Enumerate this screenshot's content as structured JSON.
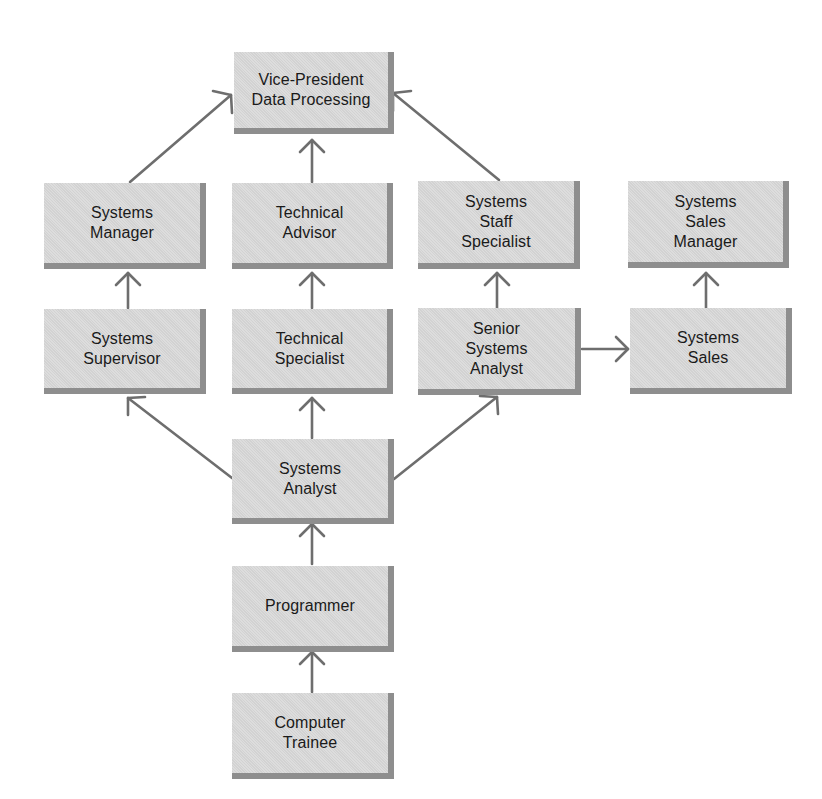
{
  "diagram": {
    "type": "career-path-flowchart",
    "colors": {
      "box_fill": "#d9d9d9",
      "box_shadow": "#8e8e8e",
      "arrow": "#6e6e6e",
      "text": "#1a1a1a",
      "background": "#ffffff"
    },
    "nodes": {
      "vp": {
        "label": "Vice-President\nData Processing"
      },
      "systems_manager": {
        "label": "Systems\nManager"
      },
      "technical_advisor": {
        "label": "Technical\nAdvisor"
      },
      "systems_staff_specialist": {
        "label": "Systems\nStaff\nSpecialist"
      },
      "systems_sales_manager": {
        "label": "Systems\nSales\nManager"
      },
      "systems_supervisor": {
        "label": "Systems\nSupervisor"
      },
      "technical_specialist": {
        "label": "Technical\nSpecialist"
      },
      "senior_systems_analyst": {
        "label": "Senior\nSystems\nAnalyst"
      },
      "systems_sales": {
        "label": "Systems\nSales"
      },
      "systems_analyst": {
        "label": "Systems\nAnalyst"
      },
      "programmer": {
        "label": "Programmer"
      },
      "computer_trainee": {
        "label": "Computer\nTrainee"
      }
    },
    "edges": [
      {
        "from": "computer_trainee",
        "to": "programmer"
      },
      {
        "from": "programmer",
        "to": "systems_analyst"
      },
      {
        "from": "systems_analyst",
        "to": "systems_supervisor"
      },
      {
        "from": "systems_analyst",
        "to": "technical_specialist"
      },
      {
        "from": "systems_analyst",
        "to": "senior_systems_analyst"
      },
      {
        "from": "systems_supervisor",
        "to": "systems_manager"
      },
      {
        "from": "technical_specialist",
        "to": "technical_advisor"
      },
      {
        "from": "senior_systems_analyst",
        "to": "systems_staff_specialist"
      },
      {
        "from": "senior_systems_analyst",
        "to": "systems_sales"
      },
      {
        "from": "systems_sales",
        "to": "systems_sales_manager"
      },
      {
        "from": "systems_manager",
        "to": "vp"
      },
      {
        "from": "technical_advisor",
        "to": "vp"
      },
      {
        "from": "systems_staff_specialist",
        "to": "vp"
      }
    ]
  }
}
